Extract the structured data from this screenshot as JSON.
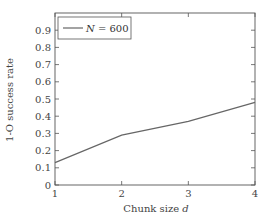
{
  "chart_data": {
    "type": "line",
    "title": "",
    "xlabel": "Chunk size d",
    "xlabel_main": "Chunk size ",
    "xlabel_var": "d",
    "ylabel": "1-O success rate",
    "x": [
      1,
      2,
      3,
      4
    ],
    "series": [
      {
        "name": "N = 600",
        "values": [
          0.13,
          0.29,
          0.37,
          0.48
        ],
        "color": "#666666"
      }
    ],
    "xlim": [
      1,
      4
    ],
    "ylim": [
      0,
      1.0
    ],
    "xticks": [
      "1",
      "2",
      "3",
      "4"
    ],
    "yticks": [
      "0",
      "0.1",
      "0.2",
      "0.3",
      "0.4",
      "0.5",
      "0.6",
      "0.7",
      "0.8",
      "0.9"
    ],
    "grid": false,
    "legend_position": "upper left",
    "legend": {
      "var": "N",
      "rest": " = 600"
    }
  }
}
